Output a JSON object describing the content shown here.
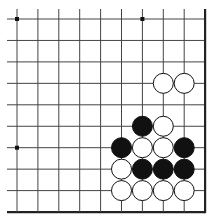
{
  "board": {
    "columns": 10,
    "rows": 10,
    "origin_x": 17,
    "origin_y": 19,
    "spacing_x": 20.9,
    "spacing_y": 21.45,
    "stone_radius": 10,
    "line_color": "#444444",
    "edge_color": "#222222",
    "black_color": "#111111",
    "white_color": "#ffffff",
    "star_points": [
      {
        "col": 0,
        "row": 0
      },
      {
        "col": 6,
        "row": 0
      },
      {
        "col": 0,
        "row": 6
      }
    ],
    "stones": [
      {
        "col": 7,
        "row": 3,
        "color": "white"
      },
      {
        "col": 8,
        "row": 3,
        "color": "white"
      },
      {
        "col": 6,
        "row": 5,
        "color": "black"
      },
      {
        "col": 7,
        "row": 5,
        "color": "white"
      },
      {
        "col": 5,
        "row": 6,
        "color": "black"
      },
      {
        "col": 6,
        "row": 6,
        "color": "white"
      },
      {
        "col": 7,
        "row": 6,
        "color": "white"
      },
      {
        "col": 8,
        "row": 6,
        "color": "black"
      },
      {
        "col": 5,
        "row": 7,
        "color": "white"
      },
      {
        "col": 6,
        "row": 7,
        "color": "black"
      },
      {
        "col": 7,
        "row": 7,
        "color": "black"
      },
      {
        "col": 8,
        "row": 7,
        "color": "black"
      },
      {
        "col": 5,
        "row": 8,
        "color": "white"
      },
      {
        "col": 6,
        "row": 8,
        "color": "white"
      },
      {
        "col": 7,
        "row": 8,
        "color": "white"
      },
      {
        "col": 8,
        "row": 8,
        "color": "white"
      }
    ]
  }
}
